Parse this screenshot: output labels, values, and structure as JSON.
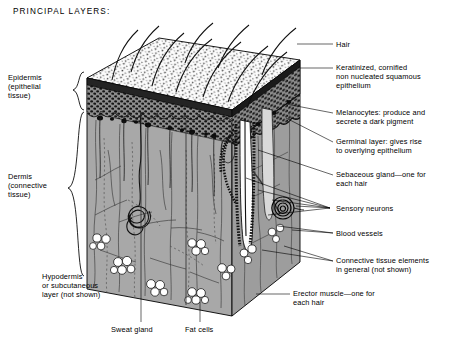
{
  "title": "PRINCIPAL LAYERS:",
  "diagram": {
    "name": "skin-cross-section-block",
    "colors": {
      "dermis_fill": "#a8a8a8",
      "epidermis_fill": "#8a8a8a",
      "stratum_corneum": "#2b2b2b",
      "surface_fill": "#fbfbfb",
      "ink": "#000000",
      "fat_cell_fill": "#ffffff"
    }
  },
  "brace_labels": [
    {
      "id": "epidermis",
      "text": "Epidermis\n(epithelial\ntissue)"
    },
    {
      "id": "dermis",
      "text": "Dermis\n(connective\ntissue)"
    }
  ],
  "left_labels": [
    {
      "id": "hypodermis",
      "text": "Hypodermis\nor subcutaneous\nlayer (not shown)"
    }
  ],
  "bottom_labels": [
    {
      "id": "sweat-gland",
      "text": "Sweat gland"
    },
    {
      "id": "fat-cells",
      "text": "Fat cells"
    }
  ],
  "right_labels": [
    {
      "id": "hair",
      "text": "Hair"
    },
    {
      "id": "keratinized",
      "text": "Keratinized, cornified\nnon nucleated squamous\nepithelium"
    },
    {
      "id": "melanocytes",
      "text": "Melanocytes:  produce and\nsecrete a dark pigment"
    },
    {
      "id": "germinal-layer",
      "text": "Germinal layer:  gives rise\nto overlying epithelium"
    },
    {
      "id": "sebaceous-gland",
      "text": "Sebaceous gland—one for\neach hair"
    },
    {
      "id": "sensory-neurons",
      "text": "Sensory neurons"
    },
    {
      "id": "blood-vessels",
      "text": "Blood vessels"
    },
    {
      "id": "connective-tissue",
      "text": "Connective tissue elements\nin general (not shown)"
    },
    {
      "id": "erector-muscle",
      "text": "Erector muscle—one for\neach hair"
    }
  ]
}
